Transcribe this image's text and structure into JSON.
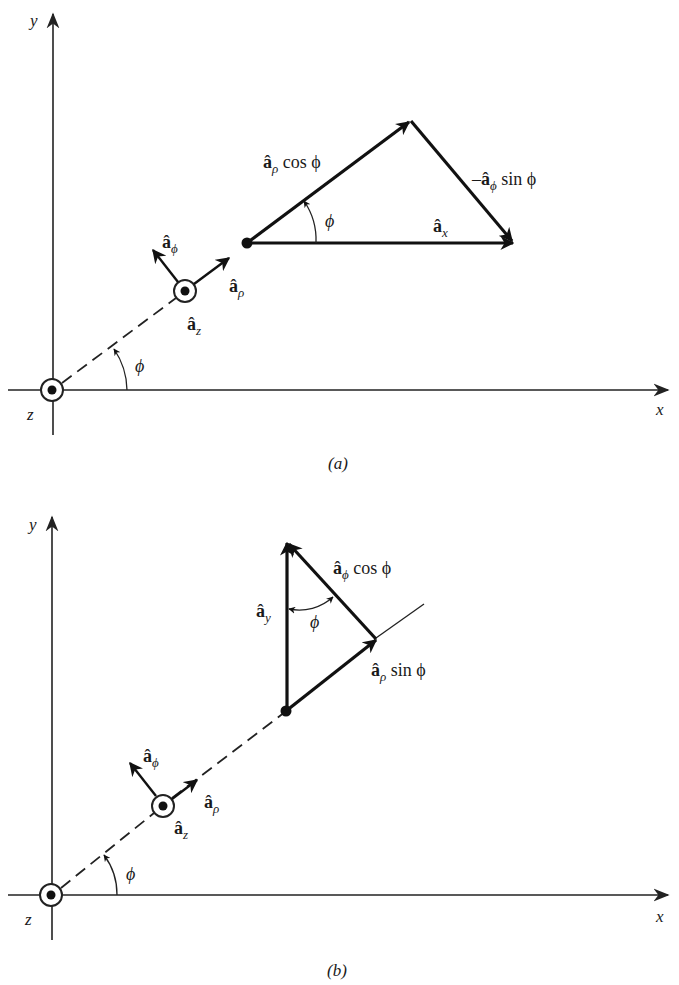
{
  "figure": {
    "panels": [
      {
        "id": "a",
        "caption": "(a)",
        "axes": {
          "x_label": "x",
          "y_label": "y",
          "z_label": "z"
        },
        "unit_vectors": {
          "a_phi": "â",
          "a_phi_sub": "ϕ",
          "a_rho": "â",
          "a_rho_sub": "ρ",
          "a_z": "â",
          "a_z_sub": "z"
        },
        "angle_label_origin": "ϕ",
        "triangle": {
          "side1_vec": "â",
          "side1_sub": "ρ",
          "side1_text": " cos ϕ",
          "side2_prefix": "–",
          "side2_vec": "â",
          "side2_sub": "ϕ",
          "side2_text": " sin ϕ",
          "result_vec": "â",
          "result_sub": "x",
          "angle_label": "ϕ"
        }
      },
      {
        "id": "b",
        "caption": "(b)",
        "axes": {
          "x_label": "x",
          "y_label": "y",
          "z_label": "z"
        },
        "unit_vectors": {
          "a_phi": "â",
          "a_phi_sub": "ϕ",
          "a_rho": "â",
          "a_rho_sub": "ρ",
          "a_z": "â",
          "a_z_sub": "z"
        },
        "angle_label_origin": "ϕ",
        "triangle": {
          "side1_vec": "â",
          "side1_sub": "ϕ",
          "side1_text": " cos ϕ",
          "side2_vec": "â",
          "side2_sub": "ρ",
          "side2_text": " sin ϕ",
          "result_vec": "â",
          "result_sub": "y",
          "angle_label": "ϕ"
        }
      }
    ]
  }
}
